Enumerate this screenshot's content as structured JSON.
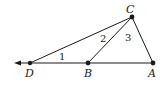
{
  "diagram": {
    "points": {
      "A": {
        "label": "A",
        "x": 153,
        "y": 63
      },
      "B": {
        "label": "B",
        "x": 88,
        "y": 63
      },
      "C": {
        "label": "C",
        "x": 132,
        "y": 17
      },
      "D": {
        "label": "D",
        "x": 30,
        "y": 63
      }
    },
    "angles": {
      "angle1": {
        "label": "1"
      },
      "angle2": {
        "label": "2"
      },
      "angle3": {
        "label": "3"
      }
    },
    "segments": [
      "DC",
      "BC",
      "CA",
      "DA"
    ],
    "ray": "from A through D extending left (arrow)",
    "colors": {
      "stroke": "#1a1a1a",
      "background": "#ffffff"
    }
  }
}
